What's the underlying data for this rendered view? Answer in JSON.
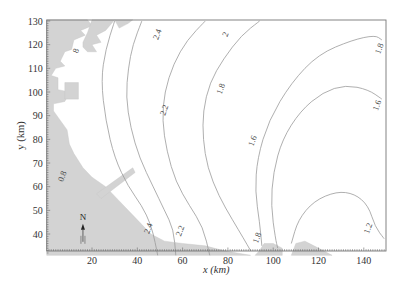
{
  "chart_data": {
    "type": "contour",
    "title": "",
    "xlabel": "x (km)",
    "ylabel": "y (km)",
    "xlim": [
      0,
      150
    ],
    "ylim": [
      31,
      131
    ],
    "x_ticks": [
      20,
      40,
      60,
      80,
      100,
      120,
      140
    ],
    "y_ticks": [
      40,
      50,
      60,
      70,
      80,
      90,
      100,
      110,
      120,
      130
    ],
    "grid": false,
    "legend": null,
    "annotations": [
      "N"
    ],
    "contour_levels": [
      0.8,
      1.2,
      1.6,
      1.8,
      2,
      2.2,
      2.4,
      1.8
    ],
    "contour_labels": [
      {
        "text": "8",
        "x": 14,
        "y": 117
      },
      {
        "text": "0.8",
        "x": 8,
        "y": 64
      },
      {
        "text": "2.4",
        "x": 50,
        "y": 124
      },
      {
        "text": "2.4",
        "x": 46,
        "y": 42
      },
      {
        "text": "2.2",
        "x": 53,
        "y": 92
      },
      {
        "text": "2.2",
        "x": 60,
        "y": 41
      },
      {
        "text": "2",
        "x": 80,
        "y": 124
      },
      {
        "text": "1.8",
        "x": 78,
        "y": 101
      },
      {
        "text": "1.8",
        "x": 94,
        "y": 38
      },
      {
        "text": "1.6",
        "x": 92,
        "y": 79
      },
      {
        "text": "1.8",
        "x": 148,
        "y": 118
      },
      {
        "text": "1.6",
        "x": 147,
        "y": 94
      },
      {
        "text": "1.2",
        "x": 143,
        "y": 42
      }
    ],
    "series": [
      {
        "name": "2.4",
        "points": [
          [
            30,
            130
          ],
          [
            26,
            118
          ],
          [
            24,
            105
          ],
          [
            26,
            88
          ],
          [
            30,
            72
          ],
          [
            36,
            60
          ],
          [
            42,
            52
          ],
          [
            46,
            44
          ],
          [
            48,
            36
          ],
          [
            49,
            31
          ]
        ]
      },
      {
        "name": "2.2",
        "points": [
          [
            42,
            130
          ],
          [
            38,
            120
          ],
          [
            36,
            110
          ],
          [
            35,
            98
          ],
          [
            37,
            85
          ],
          [
            41,
            72
          ],
          [
            47,
            60
          ],
          [
            52,
            50
          ],
          [
            56,
            42
          ],
          [
            57,
            31
          ]
        ]
      },
      {
        "name": "2",
        "points": [
          [
            70,
            130
          ],
          [
            62,
            122
          ],
          [
            56,
            112
          ],
          [
            52,
            100
          ],
          [
            51,
            88
          ],
          [
            53,
            75
          ],
          [
            57,
            62
          ],
          [
            63,
            52
          ],
          [
            69,
            43
          ],
          [
            72,
            31
          ]
        ]
      },
      {
        "name": "1.8 (west)",
        "points": [
          [
            94,
            130
          ],
          [
            86,
            124
          ],
          [
            78,
            114
          ],
          [
            72,
            104
          ],
          [
            69,
            92
          ],
          [
            69,
            80
          ],
          [
            71,
            68
          ],
          [
            76,
            56
          ],
          [
            82,
            46
          ],
          [
            87,
            38
          ],
          [
            90,
            33
          ]
        ]
      },
      {
        "name": "1.8 (east)",
        "points": [
          [
            148,
            122
          ],
          [
            145,
            124
          ],
          [
            135,
            122
          ],
          [
            120,
            116
          ],
          [
            108,
            104
          ],
          [
            98,
            88
          ],
          [
            93,
            72
          ],
          [
            92,
            58
          ],
          [
            94,
            45
          ],
          [
            95,
            35
          ]
        ]
      },
      {
        "name": "1.6",
        "points": [
          [
            148,
            97
          ],
          [
            142,
            101
          ],
          [
            132,
            103
          ],
          [
            122,
            100
          ],
          [
            112,
            92
          ],
          [
            104,
            80
          ],
          [
            100,
            66
          ],
          [
            99,
            52
          ],
          [
            101,
            38
          ],
          [
            102,
            34
          ]
        ]
      },
      {
        "name": "1.2",
        "points": [
          [
            149,
            38
          ],
          [
            145,
            43
          ],
          [
            142,
            52
          ],
          [
            136,
            57
          ],
          [
            128,
            58
          ],
          [
            118,
            54
          ],
          [
            111,
            46
          ],
          [
            108,
            36
          ]
        ]
      }
    ],
    "north_arrow": {
      "label": "N",
      "x_km": 16,
      "y_km": 46
    }
  },
  "figure": {
    "xlabel": "x (km)",
    "ylabel": "y (km)",
    "north_label": "N"
  }
}
